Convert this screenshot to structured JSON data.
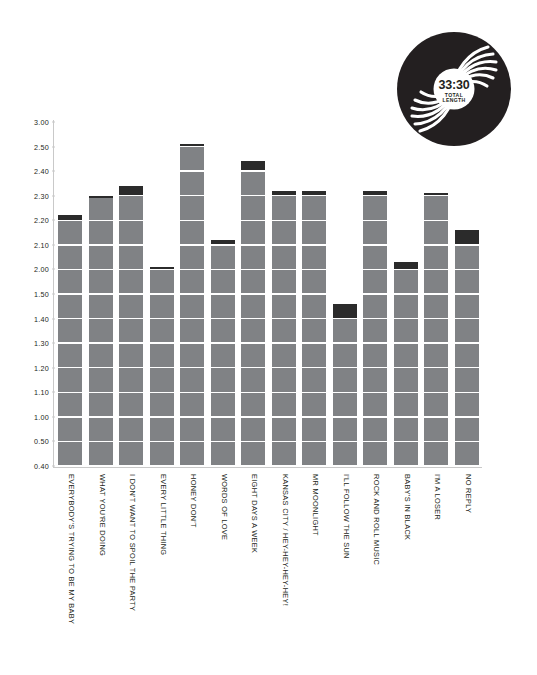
{
  "record": {
    "total_length": "33:30",
    "label_line1": "TOTAL",
    "label_line2": "LENGTH",
    "color": "#231f20"
  },
  "axis": {
    "ticks": [
      "3.00",
      "2.50",
      "2.40",
      "2.30",
      "2.20",
      "2.10",
      "2.00",
      "1.50",
      "1.40",
      "1.30",
      "1.20",
      "1.10",
      "1.00",
      "0.50",
      "0.40"
    ]
  },
  "colors": {
    "bar": "#808285",
    "cap": "#2b2b2b",
    "gridline": "#ffffff",
    "axis": "#c9c9c9",
    "text": "#231f20"
  },
  "chart_data": {
    "type": "bar",
    "title": "",
    "xlabel": "",
    "ylabel": "",
    "ylim": [
      0.4,
      3.0
    ],
    "grid": true,
    "legend": null,
    "note": "Y axis is track duration in minutes.seconds (mm.ss). Dark cap at the top of each bar marks the final partial segment of the track length.",
    "ytick_labels": [
      "3.00",
      "2.50",
      "2.40",
      "2.30",
      "2.20",
      "2.10",
      "2.00",
      "1.50",
      "1.40",
      "1.30",
      "1.20",
      "1.10",
      "1.00",
      "0.50",
      "0.40"
    ],
    "ytick_values": [
      3.0,
      2.5,
      2.4,
      2.3,
      2.2,
      2.1,
      2.0,
      1.5,
      1.4,
      1.3,
      1.2,
      1.1,
      1.0,
      0.5,
      0.4
    ],
    "categories": [
      "EVERYBODY'S TRYING TO BE MY BABY",
      "WHAT YOU'RE DOING",
      "I DON'T WANT TO SPOIL THE PARTY",
      "EVERY LITTLE THING",
      "HONEY DON'T",
      "WORDS OF LOVE",
      "EIGHT DAYS A WEEK",
      "KANSAS CITY / HEY-HEY-HEY-HEY!",
      "MR MOONLIGHT",
      "I'LL FOLLOW THE SUN",
      "ROCK AND ROLL MUSIC",
      "BABY'S IN BLACK",
      "I'M A LOSER",
      "NO REPLY"
    ],
    "values": [
      2.22,
      2.3,
      2.34,
      2.01,
      2.56,
      2.12,
      2.44,
      2.32,
      2.32,
      1.46,
      2.32,
      2.03,
      2.31,
      2.16
    ],
    "value_labels": [
      "2:22",
      "2:30",
      "2:34",
      "2:01",
      "2:56",
      "2:12",
      "2:44",
      "2:32",
      "2:32",
      "1:46",
      "2:32",
      "2:03",
      "2:31",
      "2:16"
    ],
    "cap_from": [
      2.2,
      2.3,
      2.3,
      2.0,
      2.5,
      2.1,
      2.4,
      2.3,
      2.3,
      1.4,
      2.3,
      2.0,
      2.3,
      2.1
    ]
  }
}
